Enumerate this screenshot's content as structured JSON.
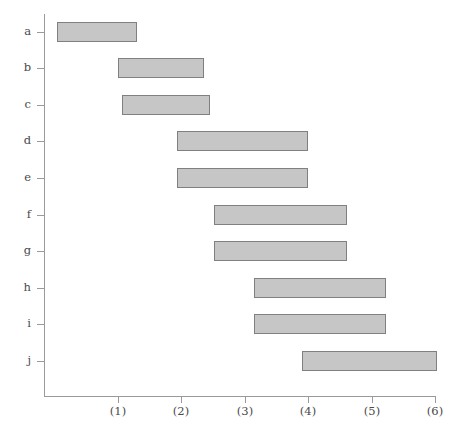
{
  "chart_data": {
    "type": "bar",
    "orientation": "horizontal",
    "subtype": "gantt-range-bars",
    "title": "",
    "subtitle": "",
    "xlabel": "",
    "ylabel": "",
    "grid": false,
    "legend": null,
    "xlim": [
      0,
      6.2
    ],
    "x_ticks": [
      1,
      2,
      3,
      4,
      5,
      6
    ],
    "x_tick_labels": [
      "(1)",
      "(2)",
      "(3)",
      "(4)",
      "(5)",
      "(6)"
    ],
    "categories": [
      "a",
      "b",
      "c",
      "d",
      "e",
      "f",
      "g",
      "h",
      "i",
      "j"
    ],
    "y_tick_labels": [
      "a",
      "b",
      "c",
      "d",
      "e",
      "f",
      "g",
      "h",
      "i",
      "j"
    ],
    "bar_fill_color": "#c6c6c6",
    "bar_border_color": "#808080",
    "axis_color": "#9a9a9a",
    "text_color": "#4a4a4a",
    "background_color": "#ffffff",
    "bars": [
      {
        "category": "a",
        "start": 0.05,
        "end": 1.3
      },
      {
        "category": "b",
        "start": 1.0,
        "end": 2.36
      },
      {
        "category": "c",
        "start": 1.07,
        "end": 2.45
      },
      {
        "category": "d",
        "start": 1.93,
        "end": 4.0
      },
      {
        "category": "e",
        "start": 1.93,
        "end": 4.0
      },
      {
        "category": "f",
        "start": 2.52,
        "end": 4.61
      },
      {
        "category": "g",
        "start": 2.52,
        "end": 4.61
      },
      {
        "category": "h",
        "start": 3.15,
        "end": 5.23
      },
      {
        "category": "i",
        "start": 3.15,
        "end": 5.23
      },
      {
        "category": "j",
        "start": 3.91,
        "end": 6.03
      }
    ]
  }
}
